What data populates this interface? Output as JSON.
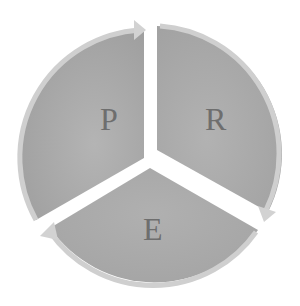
{
  "diagram": {
    "type": "cycle",
    "segments": [
      {
        "label": "P",
        "position": "left"
      },
      {
        "label": "R",
        "position": "right"
      },
      {
        "label": "E",
        "position": "bottom"
      }
    ],
    "colors": {
      "segment_fill": "#a8a8a8",
      "segment_dark": "#9a9a9a",
      "arrow_edge": "#d4d4d4",
      "label": "#6e6e6e",
      "background": "#ffffff"
    }
  }
}
